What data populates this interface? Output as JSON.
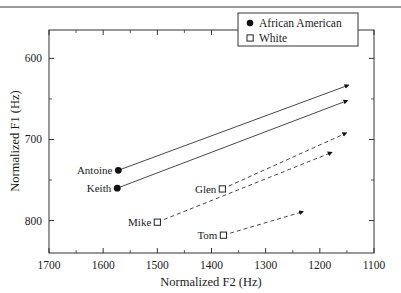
{
  "figure": {
    "top_rule": true,
    "background": "#ffffff",
    "frame_color": "#333333"
  },
  "chart_data": {
    "type": "scatter",
    "title": "",
    "xlabel": "Normalized F2  (Hz)",
    "ylabel": "Normalized F1  (Hz)",
    "xlim": [
      1700,
      1100
    ],
    "ylim": [
      840,
      565
    ],
    "x_inverted": true,
    "y_inverted": true,
    "grid": false,
    "legend_position": "top-right",
    "xticks": [
      1700,
      1600,
      1500,
      1400,
      1300,
      1200,
      1100
    ],
    "xticklabels": [
      "1700",
      "1600",
      "1500",
      "1400",
      "1300",
      "1200",
      "1100"
    ],
    "xminorticks": [
      1650,
      1550,
      1450,
      1350,
      1250,
      1150
    ],
    "yticks": [
      600,
      700,
      800
    ],
    "yticklabels": [
      "600",
      "700",
      "800"
    ],
    "yminorticks": [
      650,
      750
    ],
    "legend": [
      {
        "label": "African American",
        "marker": "filled-circle",
        "linestyle": "solid"
      },
      {
        "label": "White",
        "marker": "open-square",
        "linestyle": "dashed"
      }
    ],
    "series": [
      {
        "name": "Antoine",
        "group": "African American",
        "marker": "filled-circle",
        "linestyle": "solid",
        "label": "Antoine",
        "label_side": "left",
        "start": {
          "F2": 1572,
          "F1": 738
        },
        "end": {
          "F2": 1147,
          "F1": 633
        }
      },
      {
        "name": "Keith",
        "group": "African American",
        "marker": "filled-circle",
        "linestyle": "solid",
        "label": "Keith",
        "label_side": "left",
        "start": {
          "F2": 1574,
          "F1": 760
        },
        "end": {
          "F2": 1149,
          "F1": 652
        }
      },
      {
        "name": "Glen",
        "group": "White",
        "marker": "open-square",
        "linestyle": "dashed",
        "label": "Glen",
        "label_side": "left",
        "start": {
          "F2": 1380,
          "F1": 761
        },
        "end": {
          "F2": 1151,
          "F1": 692
        }
      },
      {
        "name": "Mike",
        "group": "White",
        "marker": "open-square",
        "linestyle": "dashed",
        "label": "Mike",
        "label_side": "left",
        "start": {
          "F2": 1500,
          "F1": 802
        },
        "end": {
          "F2": 1178,
          "F1": 716
        }
      },
      {
        "name": "Tom",
        "group": "White",
        "marker": "open-square",
        "linestyle": "dashed",
        "label": "Tom",
        "label_side": "left",
        "start": {
          "F2": 1378,
          "F1": 818
        },
        "end": {
          "F2": 1231,
          "F1": 789
        }
      }
    ]
  }
}
